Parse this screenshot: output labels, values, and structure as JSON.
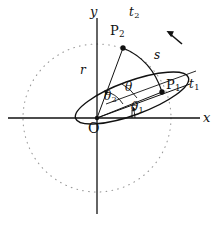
{
  "figure": {
    "type": "geometry-diagram",
    "background_color": "#ffffff",
    "stroke_color": "#111111",
    "dotted_color": "#999999"
  },
  "axes": {
    "x_label": "x",
    "y_label": "y",
    "origin_label": "O",
    "origin_px": {
      "x": 97,
      "y": 118
    },
    "x_axis_px": {
      "x1": 8,
      "y1": 118,
      "x2": 200,
      "y2": 118
    },
    "y_axis_px": {
      "x1": 97,
      "y1": 18,
      "x2": 97,
      "y2": 214
    }
  },
  "points": [
    {
      "name": "P1",
      "label": "P",
      "subscript": "1",
      "px": {
        "x": 162,
        "y": 92
      },
      "label_px": {
        "x": 167,
        "y": 83
      }
    },
    {
      "name": "P2",
      "label": "P",
      "subscript": "2",
      "px": {
        "x": 123,
        "y": 48
      },
      "label_px": {
        "x": 112,
        "y": 25
      }
    }
  ],
  "time_labels": [
    {
      "name": "t1",
      "label": "t",
      "subscript": "1",
      "px": {
        "x": 191,
        "y": 83
      }
    },
    {
      "name": "t2",
      "label": "t",
      "subscript": "2",
      "px": {
        "x": 131,
        "y": 8
      }
    }
  ],
  "angles": [
    {
      "name": "theta1",
      "label": "θ",
      "subscript": "1",
      "px": {
        "x": 134,
        "y": 107
      },
      "value_deg": 16,
      "description": "angle from x-axis to OP1"
    },
    {
      "name": "theta2",
      "label": "θ",
      "subscript": "2",
      "px": {
        "x": 106,
        "y": 96
      },
      "value_deg": 60,
      "description": "angle from OP1 direction to OP2"
    },
    {
      "name": "theta",
      "label": "θ",
      "subscript": "",
      "px": {
        "x": 128,
        "y": 87
      },
      "value_deg": 28,
      "description": "angle of ellipse major axis from x-axis"
    }
  ],
  "lengths": [
    {
      "name": "r",
      "label": "r",
      "px": {
        "x": 83,
        "y": 70
      },
      "description": "radial distance from O to P2"
    },
    {
      "name": "s",
      "label": "s",
      "px": {
        "x": 156,
        "y": 55
      },
      "description": "arc length from P1 to P2"
    }
  ],
  "ellipse": {
    "center_px": {
      "x": 132,
      "y": 98
    },
    "semi_major_px": 60,
    "semi_minor_px": 17,
    "rotation_deg": -20,
    "stroke": "#111111"
  },
  "dotted_circle": {
    "center_px": {
      "x": 97,
      "y": 118
    },
    "radius_px": 74,
    "stroke": "#999999",
    "style": "dotted"
  },
  "rotation_arrow": {
    "name": "rotation-direction-arrow",
    "from_px": {
      "x": 182,
      "y": 44
    },
    "to_px": {
      "x": 167,
      "y": 32
    },
    "description": "counter-clockwise rotation direction indicator"
  }
}
